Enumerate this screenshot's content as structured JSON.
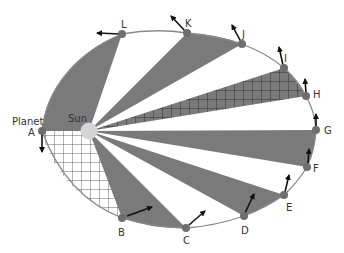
{
  "diagram": {
    "title_labels": {
      "planet": "Planet",
      "sun": "Sun"
    },
    "colors": {
      "sector_fill": "#7a7a7a",
      "orbit_stroke": "#8a8a8a",
      "grid_stroke": "#333333",
      "sun_fill": "#d4d4d4",
      "planet_fill": "#6e6e6e",
      "arrow": "#111111",
      "background": "#ffffff"
    },
    "points": [
      {
        "label": "A"
      },
      {
        "label": "B"
      },
      {
        "label": "C"
      },
      {
        "label": "D"
      },
      {
        "label": "E"
      },
      {
        "label": "F"
      },
      {
        "label": "G"
      },
      {
        "label": "H"
      },
      {
        "label": "I"
      },
      {
        "label": "J"
      },
      {
        "label": "K"
      },
      {
        "label": "L"
      }
    ],
    "sectors": [
      {
        "from": "A",
        "to": "B",
        "style": "hatched-white"
      },
      {
        "from": "B",
        "to": "C",
        "style": "solid"
      },
      {
        "from": "D",
        "to": "E",
        "style": "solid"
      },
      {
        "from": "F",
        "to": "G",
        "style": "solid"
      },
      {
        "from": "H",
        "to": "I",
        "style": "hatched-gray"
      },
      {
        "from": "J",
        "to": "K",
        "style": "solid"
      },
      {
        "from": "L",
        "to": "A",
        "style": "solid"
      }
    ]
  }
}
